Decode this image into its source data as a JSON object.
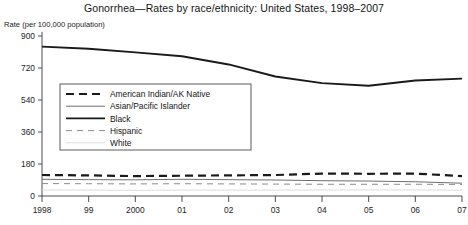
{
  "chart_data": {
    "type": "line",
    "title": "Gonorrhea—Rates by race/ethnicity: United States, 1998–2007",
    "ylabel": "Rate (per 100,000 population)",
    "xlabel": "",
    "grid": false,
    "legend_position": "inside-upper-left",
    "categories": [
      "1998",
      "99",
      "2000",
      "01",
      "02",
      "03",
      "04",
      "05",
      "06",
      "07"
    ],
    "x": [
      1998,
      1999,
      2000,
      2001,
      2002,
      2003,
      2004,
      2005,
      2006,
      2007
    ],
    "ylim": [
      0,
      900
    ],
    "yticks": [
      0,
      180,
      360,
      540,
      720,
      900
    ],
    "xtick_labels": [
      "1998",
      "99",
      "2000",
      "01",
      "02",
      "03",
      "04",
      "05",
      "06",
      "07"
    ],
    "series": [
      {
        "name": "American Indian/AK Native",
        "style": "thick-dashed",
        "color": "#1a1a1a",
        "values": [
          118,
          116,
          112,
          114,
          116,
          118,
          126,
          125,
          126,
          112
        ]
      },
      {
        "name": "Asian/Pacific Islander",
        "style": "thin-solid-gray",
        "color": "#6e6e6e",
        "values": [
          94,
          92,
          91,
          94,
          92,
          90,
          86,
          84,
          80,
          72
        ]
      },
      {
        "name": "Black",
        "style": "thick-solid",
        "color": "#1a1a1a",
        "values": [
          840,
          828,
          808,
          786,
          740,
          672,
          635,
          620,
          650,
          660
        ]
      },
      {
        "name": "Hispanic",
        "style": "thin-dashed-gray",
        "color": "#8c8c8c",
        "values": [
          70,
          69,
          68,
          69,
          68,
          67,
          66,
          66,
          66,
          65
        ]
      },
      {
        "name": "White",
        "style": "very-light-solid",
        "color": "#d8d8d8",
        "values": [
          34,
          33,
          32,
          33,
          33,
          33,
          34,
          34,
          34,
          33
        ]
      }
    ]
  }
}
